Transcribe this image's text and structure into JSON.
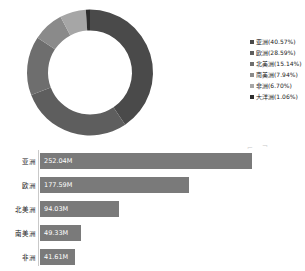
{
  "chart_data": [
    {
      "type": "pie",
      "variant": "donut",
      "title": "",
      "legend_position": "right",
      "labels": [
        "亚洲",
        "欧洲",
        "北美洲",
        "南美洲",
        "非洲",
        "大洋洲"
      ],
      "values": [
        40.57,
        28.59,
        15.14,
        7.94,
        6.7,
        1.06
      ],
      "unit": "%",
      "legend_entries": [
        "亚洲(40.57%)",
        "欧洲(28.59%)",
        "北美洲(15.14%)",
        "南美洲(7.94%)",
        "非洲(6.70%)",
        "大洋洲(1.06%)"
      ],
      "colors": [
        "#4a4a4a",
        "#5e5e5e",
        "#6e6e6e",
        "#8a8a8a",
        "#a6a6a6",
        "#2e2e2e"
      ]
    },
    {
      "type": "bar",
      "orientation": "horizontal",
      "title": "",
      "xlabel": "",
      "ylabel": "",
      "categories": [
        "亚洲",
        "欧洲",
        "北美洲",
        "南美洲",
        "非洲"
      ],
      "values": [
        252.04,
        177.59,
        94.03,
        49.33,
        41.61
      ],
      "value_labels": [
        "252.04M",
        "177.59M",
        "94.03M",
        "49.33M",
        "41.61M"
      ],
      "unit": "M",
      "xlim": [
        0,
        252.04
      ],
      "grid": false,
      "bar_color": "#7a7a7a",
      "axis_color": "#c9c9c9"
    }
  ],
  "donut": {
    "segments": [
      {
        "label": "亚洲",
        "percent": 40.57,
        "color": "#4a4a4a"
      },
      {
        "label": "欧洲",
        "percent": 28.59,
        "color": "#5e5e5e"
      },
      {
        "label": "北美洲",
        "percent": 15.14,
        "color": "#6e6e6e"
      },
      {
        "label": "南美洲",
        "percent": 7.94,
        "color": "#8a8a8a"
      },
      {
        "label": "非洲",
        "percent": 6.7,
        "color": "#a6a6a6"
      },
      {
        "label": "大洋洲",
        "percent": 1.06,
        "color": "#2e2e2e"
      }
    ]
  },
  "legend": {
    "items": [
      {
        "text": "亚洲(40.57%)",
        "color": "#4a4a4a"
      },
      {
        "text": "欧洲(28.59%)",
        "color": "#5e5e5e"
      },
      {
        "text": "北美洲(15.14%)",
        "color": "#6e6e6e"
      },
      {
        "text": "南美洲(7.94%)",
        "color": "#8a8a8a"
      },
      {
        "text": "非洲(6.70%)",
        "color": "#a6a6a6"
      },
      {
        "text": "大洋洲(1.06%)",
        "color": "#2e2e2e"
      }
    ]
  },
  "bar_chart": {
    "max_value": 252.04,
    "rows": [
      {
        "category": "亚洲",
        "value": 252.04,
        "value_label": "252.04M"
      },
      {
        "category": "欧洲",
        "value": 177.59,
        "value_label": "177.59M"
      },
      {
        "category": "北美洲",
        "value": 94.03,
        "value_label": "94.03M"
      },
      {
        "category": "南美洲",
        "value": 49.33,
        "value_label": "49.33M"
      },
      {
        "category": "非洲",
        "value": 41.61,
        "value_label": "41.61M"
      }
    ]
  }
}
